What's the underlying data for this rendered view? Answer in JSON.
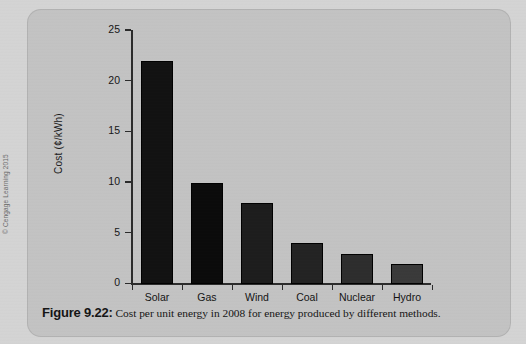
{
  "figure": {
    "caption_label": "Figure 9.22:",
    "caption_text": "Cost per unit energy in 2008 for energy produced by different methods.",
    "copyright": "© Cengage Learning 2015",
    "card_color": "#c3c3c3",
    "page_color": "#d4d4d4"
  },
  "chart_data": {
    "type": "bar",
    "title": "",
    "subtitle": "",
    "xlabel": "",
    "ylabel": "Cost (¢/kWh)",
    "categories": [
      "Solar",
      "Gas",
      "Wind",
      "Coal",
      "Nuclear",
      "Hydro"
    ],
    "values": [
      22,
      10,
      8,
      4,
      3,
      2
    ],
    "series": [
      {
        "name": "Cost per unit energy (2008)",
        "values": [
          22,
          10,
          8,
          4,
          3,
          2
        ]
      }
    ],
    "ylim": [
      0,
      25
    ],
    "xlim": [
      0,
      6
    ],
    "ytick_labels": [
      "0",
      "5",
      "10",
      "15",
      "20",
      "25"
    ],
    "ytick_values": [
      0,
      5,
      10,
      15,
      20,
      25
    ],
    "grid": false,
    "legend": false,
    "legend_position": "none",
    "bar_color": "#161616",
    "axis_color": "#2b2b2b",
    "units": "¢/kWh",
    "year": 2008
  }
}
